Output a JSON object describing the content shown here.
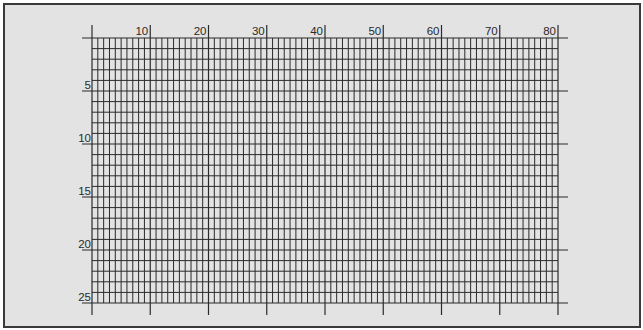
{
  "diagram": {
    "type": "character-grid-layout-sheet",
    "columns": 80,
    "rows": 25,
    "column_labels": [
      "10",
      "20",
      "30",
      "40",
      "50",
      "60",
      "70",
      "80"
    ],
    "column_label_values": [
      10,
      20,
      30,
      40,
      50,
      60,
      70,
      80
    ],
    "row_labels": [
      "5",
      "10",
      "15",
      "20",
      "25"
    ],
    "row_label_values": [
      5,
      10,
      15,
      20,
      25
    ],
    "colors": {
      "background": "#e3e3e3",
      "grid_line": "#2a2a2a",
      "frame_border": "#3a3a3a",
      "label_text": "#2a2a2a"
    }
  }
}
